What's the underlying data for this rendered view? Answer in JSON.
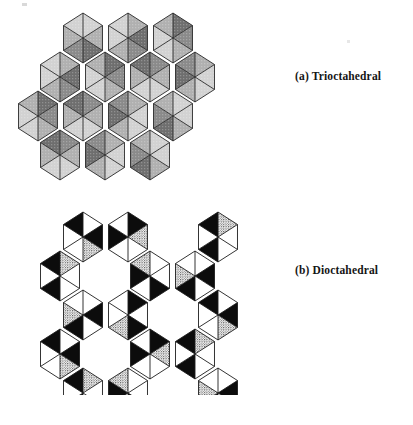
{
  "page": {
    "width": 413,
    "height": 425,
    "background": "#ffffff",
    "kind": "figure"
  },
  "captions": {
    "a": "(a) Trioctahedral",
    "b": "(b) Dioctahedral"
  },
  "figures": [
    {
      "id": "trioctahedral",
      "label": "(a) Trioctahedral",
      "description": "Continuous sheet of edge-sharing octahedra; all octahedral sites occupied.",
      "site_occupancy": "3 of 3",
      "vacancies": 0,
      "render": {
        "face_light": "#d2d2d2",
        "face_mid": "#b0b0b0",
        "face_dark": "#8a8a8a",
        "face_darker": "#6e6e6e",
        "edge": "#2a2a2a",
        "edge_width": 0.9
      },
      "lattice": {
        "type": "hexagonal-close-packed-sheet",
        "cell_width": 45,
        "cell_height": 39,
        "rows": [
          {
            "y": 38,
            "xs": [
              83,
              128,
              173
            ]
          },
          {
            "y": 77,
            "xs": [
              60,
              105,
              150,
              195
            ]
          },
          {
            "y": 116,
            "xs": [
              38,
              83,
              128,
              173
            ]
          },
          {
            "y": 155,
            "xs": [
              60,
              105,
              150
            ]
          }
        ]
      }
    },
    {
      "id": "dioctahedral",
      "label": "(b) Dioctahedral",
      "description": "Octahedral sheet with ordered vacancies; two of three octahedral sites occupied, vacant sites appear as open hexagonal holes.",
      "site_occupancy": "2 of 3",
      "vacancies": 1,
      "render": {
        "face_white": "#ffffff",
        "face_black": "#0c0c0c",
        "face_stipple": "#8e8e8e",
        "face_stipple_dark": "#5a5a5a",
        "edge": "#1d1d1d",
        "edge_width": 0.9
      },
      "lattice": {
        "type": "hexagonal-sheet-with-ordered-vacancies",
        "cell_width": 45,
        "cell_height": 39,
        "rows": [
          {
            "y": 42,
            "xs": [
              83,
              128,
              218
            ]
          },
          {
            "y": 81,
            "xs": [
              60,
              150,
              195
            ]
          },
          {
            "y": 120,
            "xs": [
              83,
              128,
              218
            ]
          },
          {
            "y": 159,
            "xs": [
              60,
              150,
              195
            ]
          },
          {
            "y": 198,
            "xs": [
              83,
              128,
              218
            ]
          }
        ]
      }
    }
  ],
  "artifacts": {
    "scan_speck_top_left": {
      "x": 22,
      "y": 3,
      "width": 5,
      "height": 3
    },
    "scan_speck_right": {
      "x": 347,
      "y": 40,
      "width": 3,
      "height": 3
    }
  }
}
